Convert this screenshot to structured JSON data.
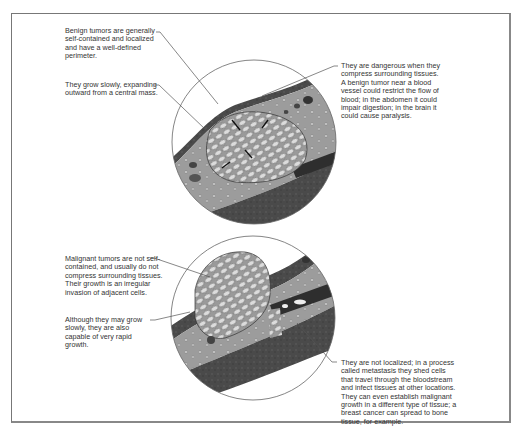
{
  "diagram": {
    "benign": {
      "labels": [
        "Benign tumors are generally self-contained and localized and have a well-defined perimeter.",
        "They grow slowly, expanding outward from a central mass.",
        "They are dangerous when they compress surrounding tissues. A benign tumor near a blood vessel could restrict the flow of blood; in the abdomen it could impair digestion; in the brain it could cause paralysis."
      ]
    },
    "malignant": {
      "labels": [
        "Malignant tumors are not self-contained, and usually do not compress surrounding tissues. Their growth is an irregular invasion of adjacent cells.",
        "Although they may grow slowly, they are also capable of very rapid growth.",
        "They are not localized; in a process called metastasis they shed cells that travel through the bloodstream and infect tissues at other locations. They can even establish malignant growth in a different type of tissue; a breast cancer can spread to bone tissue, for example."
      ]
    },
    "colors": {
      "tissue_dark": "#4a4a4a",
      "tissue_mid": "#8a8a8a",
      "tissue_light": "#b5b5b5",
      "cell_fill": "#d8d8d8",
      "line": "#555555",
      "text": "#333333"
    }
  }
}
